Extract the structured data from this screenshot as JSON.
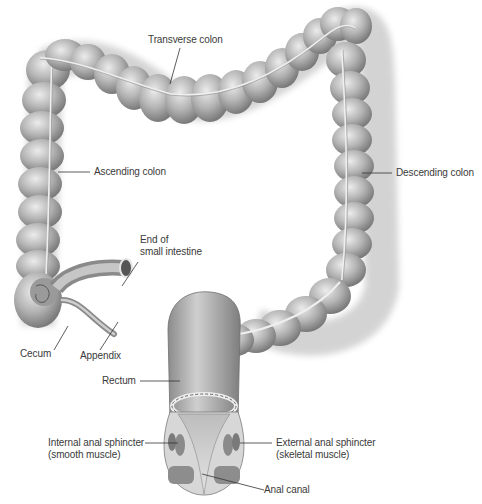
{
  "diagram": {
    "colors": {
      "background": "#ffffff",
      "tissue_light": "#d9d9d9",
      "tissue_mid": "#a8a8a8",
      "tissue_dark": "#6e6e6e",
      "label_text": "#3a3a3a",
      "leader_line": "#333333",
      "muscle": "#8a8a8a"
    },
    "labels": {
      "transverse_colon": "Transverse colon",
      "ascending_colon": "Ascending colon",
      "descending_colon": "Descending colon",
      "end_small_intestine_1": "End of",
      "end_small_intestine_2": "small intestine",
      "cecum": "Cecum",
      "appendix": "Appendix",
      "rectum": "Rectum",
      "internal_sphincter_1": "Internal anal sphincter",
      "internal_sphincter_2": "(smooth muscle)",
      "external_sphincter_1": "External anal sphincter",
      "external_sphincter_2": "(skeletal muscle)",
      "anal_canal": "Anal canal"
    }
  }
}
